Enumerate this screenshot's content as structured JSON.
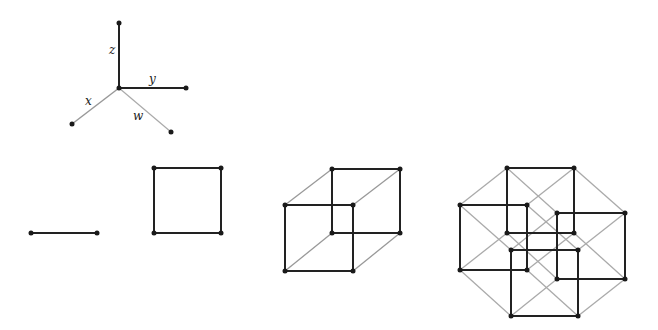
{
  "axes": {
    "labels": {
      "x": "x",
      "y": "y",
      "z": "z",
      "w": "w"
    }
  },
  "figures": [
    {
      "name": "1D segment"
    },
    {
      "name": "2D square"
    },
    {
      "name": "3D cube"
    },
    {
      "name": "4D tesseract"
    }
  ],
  "colors": {
    "dark_edge": "#222222",
    "light_edge": "#9a9a9a",
    "vertex": "#1a1a1a"
  }
}
